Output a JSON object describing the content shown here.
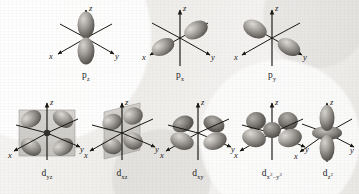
{
  "figure": {
    "background_color": "#f1f0ee",
    "ink_color": "#1a1918",
    "style": "grayscale scanned textbook illustration"
  },
  "axes": {
    "x_label": "x",
    "y_label": "y",
    "z_label": "z"
  },
  "rows": [
    {
      "name": "p-orbitals",
      "orbitals": [
        {
          "id": "pz",
          "letter": "p",
          "subscript": "z",
          "label": "pz",
          "lobe_axis": "z",
          "lobes": 2,
          "has_node_plane": false,
          "has_torus": false
        },
        {
          "id": "px",
          "letter": "p",
          "subscript": "x",
          "label": "px",
          "lobe_axis": "x",
          "lobes": 2,
          "has_node_plane": false,
          "has_torus": false
        },
        {
          "id": "py",
          "letter": "p",
          "subscript": "y",
          "label": "py",
          "lobe_axis": "y",
          "lobes": 2,
          "has_node_plane": false,
          "has_torus": false
        }
      ]
    },
    {
      "name": "d-orbitals",
      "orbitals": [
        {
          "id": "dyz",
          "letter": "d",
          "subscript": "yz",
          "label": "dyz",
          "plane": "yz",
          "lobes": 4,
          "has_node_plane": true,
          "has_torus": false
        },
        {
          "id": "dxz",
          "letter": "d",
          "subscript": "xz",
          "label": "dxz",
          "plane": "xz",
          "lobes": 4,
          "has_node_plane": true,
          "has_torus": false
        },
        {
          "id": "dxy",
          "letter": "d",
          "subscript": "xy",
          "label": "dxy",
          "plane": "xy",
          "lobes": 4,
          "has_node_plane": false,
          "has_torus": false
        },
        {
          "id": "dx2y2",
          "letter": "d",
          "subscript_base": "x",
          "subscript_sup1": "2",
          "subscript_minus": "−",
          "subscript_base2": "y",
          "subscript_sup2": "2",
          "label": "dx2-y2",
          "plane": "xy",
          "lobes": 4,
          "has_node_plane": false,
          "has_torus": false
        },
        {
          "id": "dz2",
          "letter": "d",
          "subscript_base": "z",
          "subscript_sup1": "2",
          "label": "dz2",
          "lobe_axis": "z",
          "lobes": 2,
          "has_node_plane": false,
          "has_torus": true
        }
      ]
    }
  ]
}
